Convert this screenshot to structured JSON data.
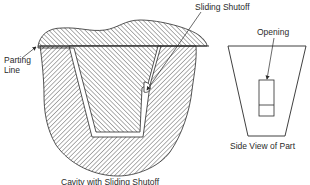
{
  "figure": {
    "labels": {
      "sliding_shutoff": "Sliding Shutoff",
      "parting_line": "Parting Line",
      "opening": "Opening",
      "side_view": "Side View of Part",
      "caption": "Cavity with Sliding Shutoff"
    },
    "colors": {
      "line": "#2a2a2a",
      "hatch": "#3a3a3a",
      "background": "#ffffff"
    }
  }
}
